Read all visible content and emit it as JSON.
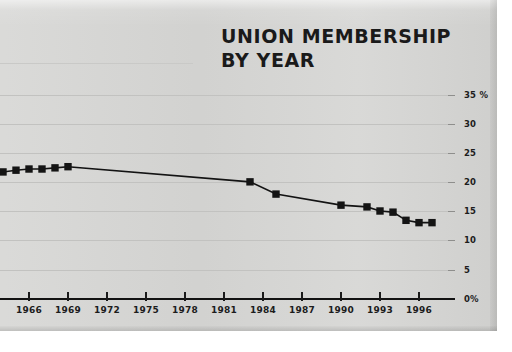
{
  "chart_data": {
    "type": "line",
    "title": "UNION MEMBERSHIP BY YEAR",
    "title_lines": [
      "UNION MEMBERSHIP",
      "BY YEAR"
    ],
    "xlabel": "",
    "ylabel": "",
    "xlim": [
      1964,
      1998
    ],
    "ylim": [
      0,
      35
    ],
    "grid": true,
    "legend": "none",
    "ytick_labels": [
      "35 %",
      "30",
      "25",
      "20",
      "15",
      "10",
      "5",
      "0%"
    ],
    "ytick_values": [
      35,
      30,
      25,
      20,
      15,
      10,
      5,
      0
    ],
    "xtick_labels": [
      "1966",
      "1969",
      "1972",
      "1975",
      "1978",
      "1981",
      "1984",
      "1987",
      "1990",
      "1993",
      "1996"
    ],
    "xtick_values": [
      1966,
      1969,
      1972,
      1975,
      1978,
      1981,
      1984,
      1987,
      1990,
      1993,
      1996
    ],
    "series": [
      {
        "name": "Union membership",
        "x": [
          1964,
          1965,
          1966,
          1967,
          1968,
          1969,
          1983,
          1985,
          1990,
          1992,
          1993,
          1994,
          1995,
          1996,
          1997
        ],
        "values": [
          21.8,
          22.1,
          22.3,
          22.3,
          22.5,
          22.7,
          20.1,
          18.0,
          16.1,
          15.8,
          15.1,
          14.9,
          13.5,
          13.1,
          13.1
        ]
      }
    ],
    "colors": {
      "panel_background": "#d6d6d4",
      "page_background": "#ffffff",
      "gridline": "#c2c2c0",
      "axis": "#121212",
      "series": "#141414",
      "text": "#1c1c1c"
    }
  }
}
